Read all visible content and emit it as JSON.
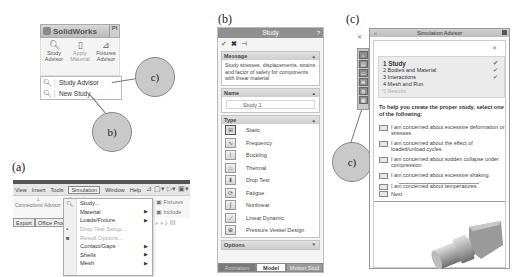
{
  "figure": {
    "labels": {
      "a": "(a)",
      "b": "(b)",
      "c": "(c)"
    },
    "callouts": {
      "b": "b)",
      "c": "c)"
    }
  },
  "panel_a_top": {
    "app_name": "SolidWorks",
    "ribbon_buttons": [
      {
        "label": "Study Advisor",
        "icon": "study-advisor-icon"
      },
      {
        "label": "Apply Material",
        "icon": "apply-material-icon"
      },
      {
        "label": "Fixtures Advisor",
        "icon": "fixtures-advisor-icon"
      }
    ],
    "dropdown_items": [
      {
        "label": "Study Advisor",
        "icon": "study-advisor-icon"
      },
      {
        "label": "New Study",
        "icon": "new-study-icon"
      }
    ]
  },
  "panel_a_bottom": {
    "menubar": [
      "View",
      "Insert",
      "Tools",
      "Simulation",
      "Window",
      "Help"
    ],
    "ribbon_left": [
      "Connections Advisor",
      "Nut",
      "Adv"
    ],
    "ribbon_right": [
      "Fixtures",
      "Include"
    ],
    "tabs": [
      "Export",
      "Office Produ"
    ],
    "simulation_menu": [
      {
        "label": "Study...",
        "icon": "study-icon",
        "submenu": false,
        "disabled": false
      },
      {
        "label": "Material",
        "submenu": true,
        "disabled": false
      },
      {
        "label": "Loads/Fixture",
        "submenu": true,
        "disabled": false
      },
      {
        "label": "Drop Test Setup...",
        "icon": "drop-test-icon",
        "submenu": false,
        "disabled": true
      },
      {
        "label": "Result Options...",
        "icon": "result-options-icon",
        "submenu": false,
        "disabled": true
      },
      {
        "label": "Contact/Gaps",
        "submenu": true,
        "disabled": false
      },
      {
        "label": "Shells",
        "submenu": true,
        "disabled": false
      },
      {
        "label": "Mesh",
        "submenu": true,
        "disabled": false
      }
    ]
  },
  "panel_b": {
    "title": "Study",
    "help": "?",
    "actions": {
      "ok": "✔",
      "cancel": "✖",
      "pin": "⊣"
    },
    "message_group": {
      "heading": "Message",
      "text": "Study stresses, displacements, strains and factor of safety for components with linear material"
    },
    "name_group": {
      "heading": "Name",
      "value": "Study 1"
    },
    "type_group": {
      "heading": "Type",
      "items": [
        {
          "label": "Static",
          "selected": true
        },
        {
          "label": "Frequency",
          "selected": false
        },
        {
          "label": "Buckling",
          "selected": false
        },
        {
          "label": "Thermal",
          "selected": false
        },
        {
          "label": "Drop Test",
          "selected": false
        },
        {
          "label": "Fatigue",
          "selected": false
        },
        {
          "label": "Nonlinear",
          "selected": false
        },
        {
          "label": "Linear Dynamic",
          "selected": false
        },
        {
          "label": "Pressure Vessel Design",
          "selected": false
        }
      ]
    },
    "options_group": {
      "heading": "Options"
    },
    "bottom_tabs": [
      "Animation",
      "Model",
      "Motion Stud"
    ]
  },
  "panel_c": {
    "title": "Simulation Advisor",
    "steps": [
      {
        "label": "1  Study",
        "state": "active",
        "checked": true
      },
      {
        "label": "2  Bodies and Material",
        "state": "normal",
        "checked": true
      },
      {
        "label": "3  Interactions",
        "state": "normal",
        "checked": true
      },
      {
        "label": "4  Mesh and Run",
        "state": "normal",
        "checked": false
      },
      {
        "label": "5  Results",
        "state": "disabled",
        "checked": false
      }
    ],
    "prompt": "To help you create the proper study, select one of the following:",
    "options": [
      "I am concerned about excessive deformation or stresses.",
      "I am concerned about the effect of loaded/unload cycles.",
      "I am concerned about sudden collapse under compression.",
      "I am concerned about excessive shaking.",
      "I am concerned about temperatures."
    ],
    "next": "Next"
  }
}
